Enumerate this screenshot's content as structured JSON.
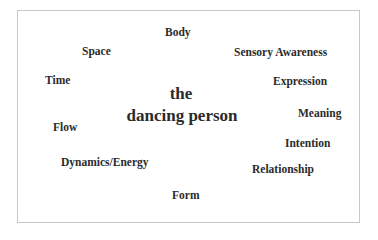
{
  "center": {
    "line1": "the",
    "line2": "dancing person"
  },
  "terms": {
    "body": "Body",
    "space": "Space",
    "sensory_awareness": "Sensory Awareness",
    "time": "Time",
    "expression": "Expression",
    "meaning": "Meaning",
    "flow": "Flow",
    "intention": "Intention",
    "dynamics_energy": "Dynamics/Energy",
    "relationship": "Relationship",
    "form": "Form"
  },
  "colors": {
    "text": "#2b2b2b",
    "border": "#c8c8c8",
    "background": "#ffffff"
  }
}
